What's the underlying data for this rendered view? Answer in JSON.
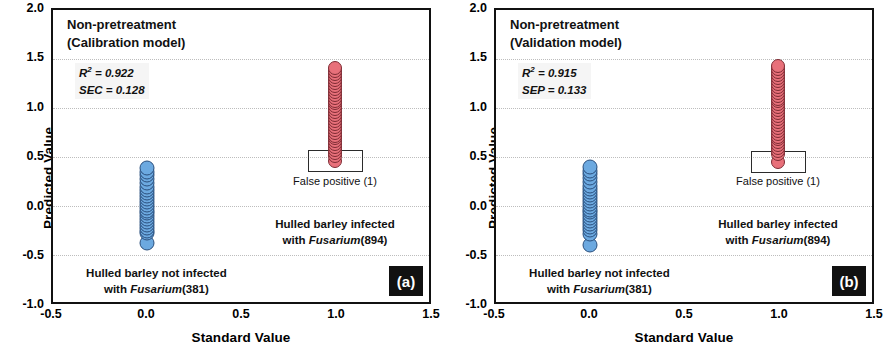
{
  "figure": {
    "panels": [
      {
        "badge": "(a)",
        "title_line1": "Non-pretreatment",
        "title_line2": "(Calibration model)",
        "stat1_name": "R",
        "stat1_sup": "2",
        "stat1_value": "= 0.922",
        "stat2_name": "SEC",
        "stat2_value": "= 0.128",
        "annotation_negative_line1": "Hulled barley not infected",
        "annotation_negative_line2_pre": "with ",
        "annotation_negative_line2_italic": "Fusarium",
        "annotation_negative_line2_post": "(381)",
        "annotation_positive_line1": "Hulled barley infected",
        "annotation_positive_line2_pre": "with ",
        "annotation_positive_line2_italic": "Fusarium",
        "annotation_positive_line2_post": "(894)",
        "false_positive_label": "False positive (1)"
      },
      {
        "badge": "(b)",
        "title_line1": "Non-pretreatment",
        "title_line2": "(Validation model)",
        "stat1_name": "R",
        "stat1_sup": "2",
        "stat1_value": "= 0.915",
        "stat2_name": "SEP",
        "stat2_value": "= 0.133",
        "annotation_negative_line1": "Hulled barley not infected",
        "annotation_negative_line2_pre": "with ",
        "annotation_negative_line2_italic": "Fusarium",
        "annotation_negative_line2_post": "(381)",
        "annotation_positive_line1": "Hulled barley infected",
        "annotation_positive_line2_pre": "with ",
        "annotation_positive_line2_italic": "Fusarium",
        "annotation_positive_line2_post": "(894)",
        "false_positive_label": "False positive (1)"
      }
    ]
  },
  "chart_data": [
    {
      "type": "scatter",
      "panel": "(a)",
      "title": "Non-pretreatment (Calibration model)",
      "xlabel": "Standard Value",
      "ylabel": "Predicted Value",
      "xlim": [
        -0.5,
        1.5
      ],
      "ylim": [
        -1.0,
        2.0
      ],
      "xticks": [
        -0.5,
        0.0,
        0.5,
        1.0,
        1.5
      ],
      "yticks": [
        -1.0,
        -0.5,
        0.0,
        0.5,
        1.0,
        1.5,
        2.0
      ],
      "grid": "horizontal-dotted",
      "legend": "none",
      "statistics": {
        "R2": 0.922,
        "SEC": 0.128
      },
      "series": [
        {
          "name": "Hulled barley not infected with Fusarium",
          "count": 381,
          "color": "#6ca9e0",
          "edge_color": "#2a4f7d",
          "x": 0.0,
          "y_min": -0.39,
          "y_max": 0.38,
          "y_values": [
            0.38,
            0.34,
            0.3,
            0.26,
            0.22,
            0.18,
            0.15,
            0.12,
            0.09,
            0.06,
            0.03,
            0.0,
            -0.03,
            -0.06,
            -0.09,
            -0.12,
            -0.15,
            -0.18,
            -0.21,
            -0.24,
            -0.27,
            -0.29,
            -0.39
          ]
        },
        {
          "name": "Hulled barley infected with Fusarium",
          "count": 894,
          "color": "#e8707a",
          "edge_color": "#7d2b33",
          "x": 1.0,
          "y_min": 0.45,
          "y_max": 1.4,
          "y_values": [
            1.4,
            1.37,
            1.34,
            1.31,
            1.28,
            1.25,
            1.22,
            1.19,
            1.16,
            1.13,
            1.1,
            1.07,
            1.04,
            1.01,
            0.98,
            0.95,
            0.92,
            0.89,
            0.86,
            0.83,
            0.8,
            0.77,
            0.74,
            0.71,
            0.68,
            0.65,
            0.62,
            0.59,
            0.56,
            0.53,
            0.5,
            0.45
          ]
        }
      ],
      "annotations": [
        {
          "text": "False positive (1)",
          "x": 1.0,
          "y": 0.3,
          "count": 1,
          "boxed_point_y": 0.45
        },
        {
          "text": "Hulled barley infected with Fusarium (894)",
          "x": 1.0,
          "y": -0.12
        },
        {
          "text": "Hulled barley not infected with Fusarium (381)",
          "x": 0.05,
          "y": -0.62
        }
      ]
    },
    {
      "type": "scatter",
      "panel": "(b)",
      "title": "Non-pretreatment (Validation model)",
      "xlabel": "Standard Value",
      "ylabel": "Predicted Value",
      "xlim": [
        -0.5,
        1.5
      ],
      "ylim": [
        -1.0,
        2.0
      ],
      "xticks": [
        -0.5,
        0.0,
        0.5,
        1.0,
        1.5
      ],
      "yticks": [
        -1.0,
        -0.5,
        0.0,
        0.5,
        1.0,
        1.5,
        2.0
      ],
      "grid": "horizontal-dotted",
      "legend": "none",
      "statistics": {
        "R2": 0.915,
        "SEP": 0.133
      },
      "series": [
        {
          "name": "Hulled barley not infected with Fusarium",
          "count": 381,
          "color": "#6ca9e0",
          "edge_color": "#2a4f7d",
          "x": 0.0,
          "y_min": -0.41,
          "y_max": 0.39,
          "y_values": [
            0.39,
            0.35,
            0.31,
            0.27,
            0.23,
            0.19,
            0.16,
            0.13,
            0.1,
            0.07,
            0.04,
            0.01,
            -0.02,
            -0.05,
            -0.08,
            -0.11,
            -0.14,
            -0.17,
            -0.2,
            -0.23,
            -0.26,
            -0.3,
            -0.41
          ]
        },
        {
          "name": "Hulled barley infected with Fusarium",
          "count": 894,
          "color": "#e8707a",
          "edge_color": "#7d2b33",
          "x": 1.0,
          "y_min": 0.44,
          "y_max": 1.42,
          "y_values": [
            1.42,
            1.39,
            1.36,
            1.33,
            1.3,
            1.27,
            1.24,
            1.21,
            1.18,
            1.15,
            1.12,
            1.09,
            1.06,
            1.03,
            1.0,
            0.97,
            0.94,
            0.91,
            0.88,
            0.85,
            0.82,
            0.79,
            0.76,
            0.73,
            0.7,
            0.67,
            0.64,
            0.61,
            0.58,
            0.55,
            0.52,
            0.44
          ]
        }
      ],
      "annotations": [
        {
          "text": "False positive (1)",
          "x": 1.0,
          "y": 0.3,
          "count": 1,
          "boxed_point_y": 0.44
        },
        {
          "text": "Hulled barley infected with Fusarium (894)",
          "x": 1.0,
          "y": -0.12
        },
        {
          "text": "Hulled barley not infected with Fusarium (381)",
          "x": 0.05,
          "y": -0.62
        }
      ]
    }
  ],
  "axes": {
    "xlabel": "Standard Value",
    "ylabel": "Predicted Value",
    "xticks": [
      "-0.5",
      "0.0",
      "0.5",
      "1.0",
      "1.5"
    ],
    "yticks": [
      "2.0",
      "1.5",
      "1.0",
      "0.5",
      "0.0",
      "-0.5",
      "-1.0"
    ]
  }
}
